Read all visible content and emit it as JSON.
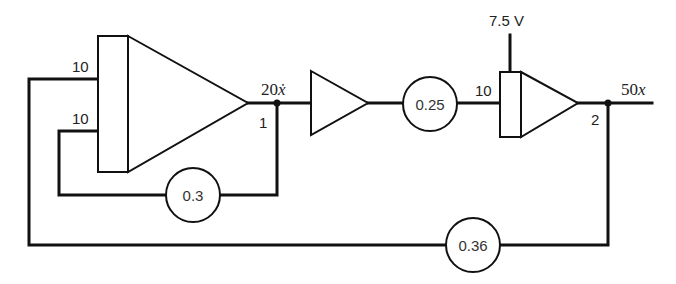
{
  "diagram": {
    "type": "analog-computer-block-diagram",
    "integrator_1": {
      "input_gains": [
        "10",
        "10"
      ],
      "output_node": "1",
      "output_signal": {
        "coef": "20",
        "var": "ẋ"
      }
    },
    "inverter": {},
    "pot_1": {
      "value": "0.25"
    },
    "integrator_2": {
      "input_gain": "10",
      "initial_condition": "7.5 V",
      "output_node": "2",
      "output_signal": {
        "coef": "50",
        "var": "x"
      }
    },
    "pot_feedback_1": {
      "value": "0.3"
    },
    "pot_feedback_2": {
      "value": "0.36"
    },
    "colors": {
      "line": "#111111",
      "background": "#ffffff"
    }
  }
}
